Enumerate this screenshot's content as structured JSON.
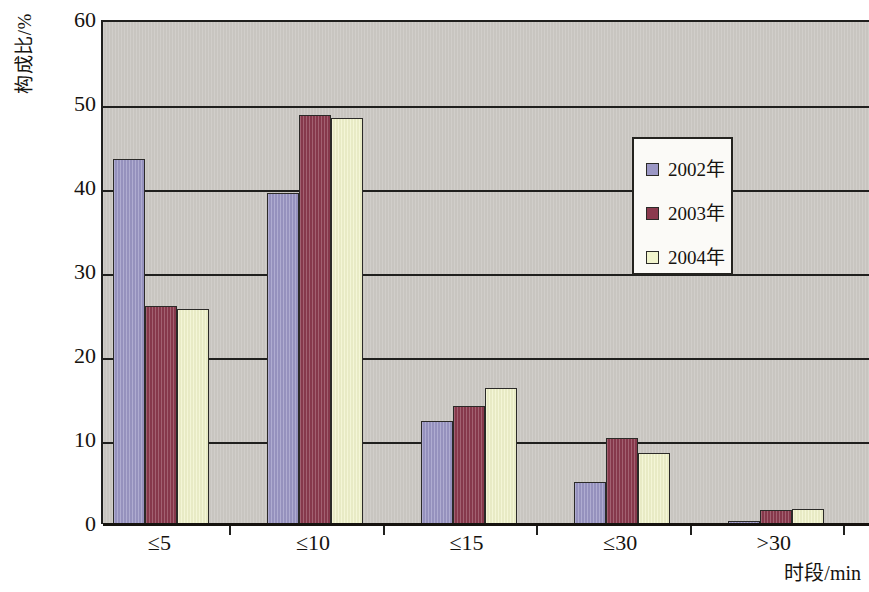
{
  "chart_data": {
    "type": "bar",
    "title": "",
    "xlabel": "时段/min",
    "ylabel": "构成比/%",
    "categories": [
      "≤5",
      "≤10",
      "≤15",
      "≤30",
      ">30"
    ],
    "series": [
      {
        "name": "2002年",
        "color": "#9b97c5",
        "values": [
          43.4,
          39.4,
          12.3,
          5.0,
          0.3
        ]
      },
      {
        "name": "2003年",
        "color": "#8b3a4e",
        "values": [
          25.9,
          48.7,
          14.0,
          10.2,
          1.7
        ]
      },
      {
        "name": "2004年",
        "color": "#f1f4cd",
        "values": [
          25.6,
          48.3,
          16.2,
          8.4,
          1.8
        ]
      }
    ],
    "ylim": [
      0,
      60
    ],
    "yticks": [
      0,
      10,
      20,
      30,
      40,
      50,
      60
    ],
    "ytick_labels": [
      "0",
      "10",
      "20",
      "30",
      "40",
      "50",
      "60"
    ],
    "grid": true,
    "legend_position": "upper right",
    "plot_background": "#c8c5c0",
    "axis_color": "#20201e"
  }
}
